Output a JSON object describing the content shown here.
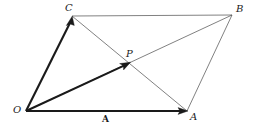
{
  "figure": {
    "kind": "vector-parallelogram-diagram",
    "width": 255,
    "height": 132,
    "background_color": "#ffffff",
    "stroke_color": "#1a1a1a",
    "thin_stroke_color": "#4a4a4a",
    "thick_stroke_width": 2.1,
    "thin_stroke_width": 0.7
  },
  "points": {
    "O": {
      "label": "O",
      "x": 26,
      "y": 111,
      "label_x": 13,
      "label_y": 105
    },
    "A": {
      "label": "A",
      "x": 187,
      "y": 111,
      "label_x": 190,
      "label_y": 112
    },
    "B": {
      "label": "B",
      "x": 232,
      "y": 15,
      "label_x": 236,
      "label_y": 4
    },
    "C": {
      "label": "C",
      "x": 72,
      "y": 16,
      "label_x": 65,
      "label_y": 3
    },
    "P": {
      "label": "P",
      "x": 130,
      "y": 62,
      "label_x": 126,
      "label_y": 49
    }
  },
  "edge_labels": [
    {
      "label": "A",
      "x": 102,
      "y": 115
    }
  ],
  "segments": [
    {
      "name": "vector-O-to-A",
      "from": "O",
      "to": "A",
      "weight": "thick",
      "arrow": true
    },
    {
      "name": "vector-O-to-C",
      "from": "O",
      "to": "C",
      "weight": "thick",
      "arrow": true
    },
    {
      "name": "vector-O-to-P",
      "from": "O",
      "to": "P",
      "weight": "thick",
      "arrow": true
    },
    {
      "name": "edge-C-to-B",
      "from": "C",
      "to": "B",
      "weight": "thin",
      "arrow": false
    },
    {
      "name": "edge-A-to-B",
      "from": "A",
      "to": "B",
      "weight": "thin",
      "arrow": false
    },
    {
      "name": "diagonal-C-to-A",
      "from": "C",
      "to": "A",
      "weight": "thin",
      "arrow": false
    },
    {
      "name": "diagonal-O-to-B",
      "from": "O",
      "to": "B",
      "weight": "thin",
      "arrow": false
    }
  ]
}
